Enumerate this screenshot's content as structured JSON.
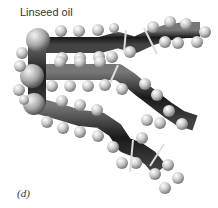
{
  "figure": {
    "title": "Linseed oil",
    "panel_label": "(d)",
    "colors": {
      "carbon": "#2a2a2a",
      "hydrogen": "#cfcfcf",
      "oxygen": "#bdbdbd",
      "double_bond": "#e0e0e0"
    }
  }
}
